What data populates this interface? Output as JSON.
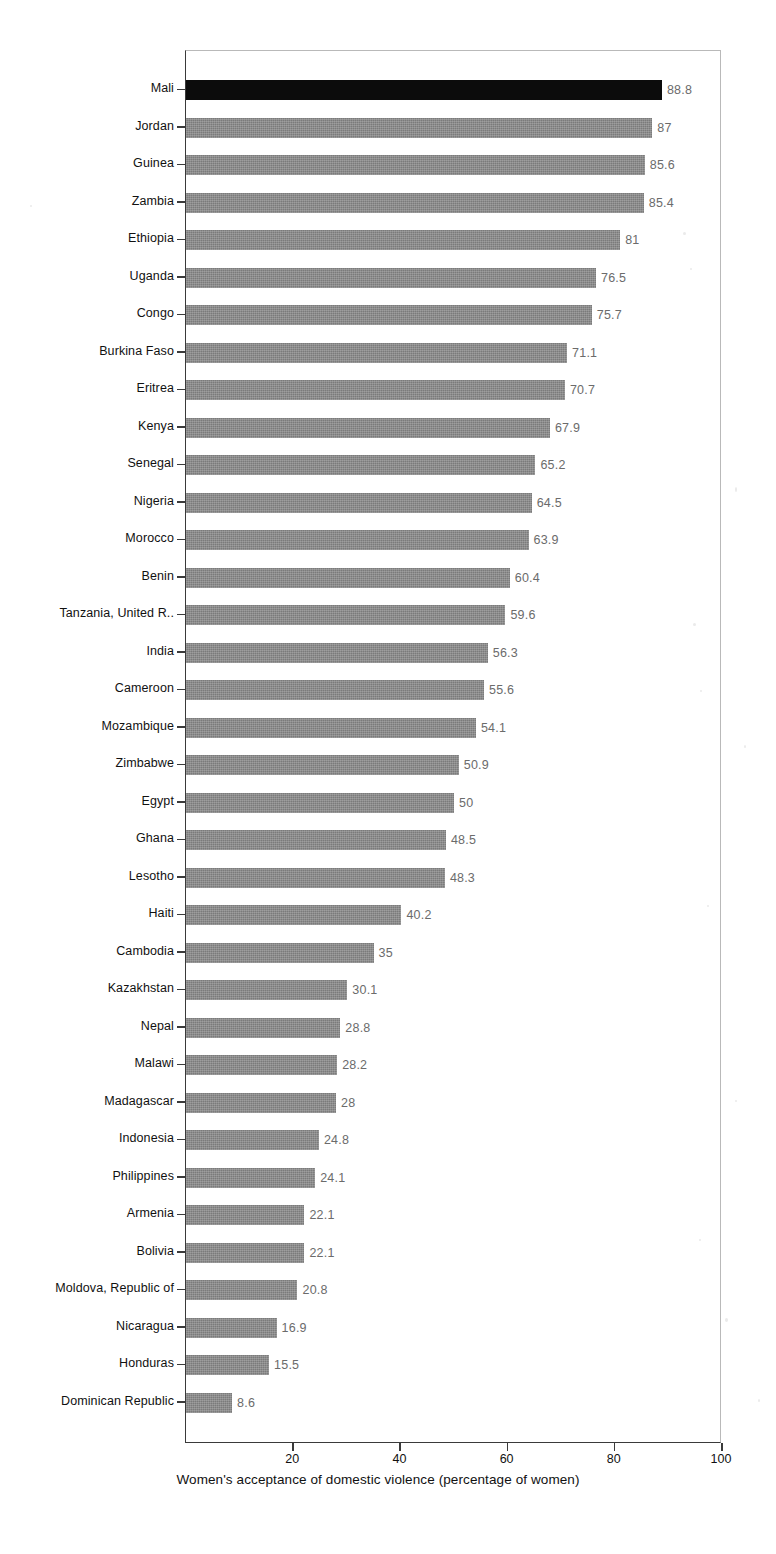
{
  "chart_data": {
    "type": "bar",
    "orientation": "horizontal",
    "title": "",
    "subtitle": "",
    "xlabel": "Women's acceptance of domestic violence (percentage of women)",
    "ylabel": "",
    "xlim": [
      0,
      100
    ],
    "xticks": [
      20,
      40,
      60,
      80,
      100
    ],
    "xtick_labels": [
      "20",
      "40",
      "60",
      "80",
      "100"
    ],
    "grid": false,
    "legend": null,
    "highlight_category": "Mali",
    "bar_color": "#7b7b7b",
    "highlight_color": "#0c0c0c",
    "value_label_color": "#6b6b6b",
    "categories": [
      "Mali",
      "Jordan",
      "Guinea",
      "Zambia",
      "Ethiopia",
      "Uganda",
      "Congo",
      "Burkina Faso",
      "Eritrea",
      "Kenya",
      "Senegal",
      "Nigeria",
      "Morocco",
      "Benin",
      "Tanzania, United R..",
      "India",
      "Cameroon",
      "Mozambique",
      "Zimbabwe",
      "Egypt",
      "Ghana",
      "Lesotho",
      "Haiti",
      "Cambodia",
      "Kazakhstan",
      "Nepal",
      "Malawi",
      "Madagascar",
      "Indonesia",
      "Philippines",
      "Armenia",
      "Bolivia",
      "Moldova, Republic of",
      "Nicaragua",
      "Honduras",
      "Dominican Republic"
    ],
    "values": [
      88.8,
      87,
      85.6,
      85.4,
      81,
      76.5,
      75.7,
      71.1,
      70.7,
      67.9,
      65.2,
      64.5,
      63.9,
      60.4,
      59.6,
      56.3,
      55.6,
      54.1,
      50.9,
      50,
      48.5,
      48.3,
      40.2,
      35,
      30.1,
      28.8,
      28.2,
      28,
      24.8,
      24.1,
      22.1,
      22.1,
      20.8,
      16.9,
      15.5,
      8.6
    ],
    "value_labels": [
      "88.8",
      "87",
      "85.6",
      "85.4",
      "81",
      "76.5",
      "75.7",
      "71.1",
      "70.7",
      "67.9",
      "65.2",
      "64.5",
      "63.9",
      "60.4",
      "59.6",
      "56.3",
      "55.6",
      "54.1",
      "50.9",
      "50",
      "48.5",
      "48.3",
      "40.2",
      "35",
      "30.1",
      "28.8",
      "28.2",
      "28",
      "24.8",
      "24.1",
      "22.1",
      "22.1",
      "20.8",
      "16.9",
      "15.5",
      "8.6"
    ]
  }
}
